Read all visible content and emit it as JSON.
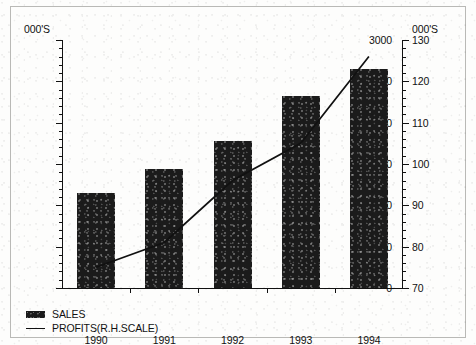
{
  "chart_data": {
    "type": "bar",
    "title": "",
    "subtitle": "",
    "xlabel": "",
    "ylabel": "000'S",
    "y2label": "000'S",
    "categories": [
      "1990",
      "1991",
      "1992",
      "1993",
      "1994"
    ],
    "grid": false,
    "legend_position": "bottom-left",
    "ylim": [
      0,
      3000
    ],
    "yticks": [
      0,
      500,
      1000,
      1500,
      2000,
      2500,
      3000
    ],
    "ytick_labels": [
      "0",
      "500",
      "1000",
      "1500",
      "2000",
      "2500",
      "3000"
    ],
    "y_minor_interval": 100,
    "y2lim": [
      70,
      130
    ],
    "y2ticks": [
      70,
      80,
      90,
      100,
      110,
      120,
      130
    ],
    "y2tick_labels": [
      "70",
      "80",
      "90",
      "100",
      "110",
      "120",
      "130"
    ],
    "y2_minor_interval": 2,
    "series": [
      {
        "name": "SALES",
        "type": "bar",
        "axis": "left",
        "color": "#1b1b1b",
        "values": [
          1150,
          1440,
          1780,
          2320,
          2650
        ]
      },
      {
        "name": "PROFITS(R.H.SCALE)",
        "type": "line",
        "axis": "right",
        "color": "#111111",
        "values": [
          75,
          81,
          96,
          105,
          126
        ]
      }
    ],
    "annotations": []
  },
  "legend": {
    "items": [
      {
        "label": "SALES",
        "marker": "filled-rect-swatch"
      },
      {
        "label": "PROFITS(R.H.SCALE)",
        "marker": "solid-line-swatch"
      }
    ]
  },
  "colors": {
    "bar_fill": "#1b1b1b",
    "line": "#111111",
    "axis": "#111111",
    "frame": "#b9b9b6",
    "background": "#fdfdfc",
    "text": "#111111"
  }
}
